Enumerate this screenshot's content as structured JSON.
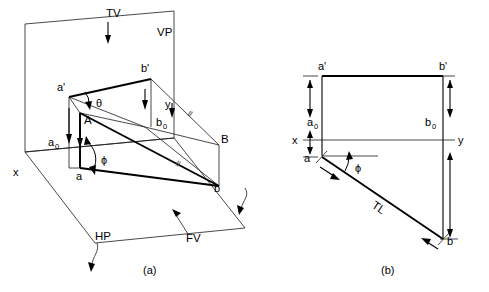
{
  "figure": {
    "panels": [
      {
        "key": "a",
        "caption": "(a)",
        "description": "Pictorial view showing line AB in space with VP and HP planes"
      },
      {
        "key": "b",
        "caption": "(b)",
        "description": "Orthographic projection with xy reference line"
      }
    ]
  },
  "colors": {
    "line": "#000000",
    "thin_line": "#1a1a1a",
    "background": "#ffffff",
    "parallel_mark": "#444444"
  },
  "panel_a": {
    "caption": "(a)",
    "planes": {
      "vp_label": "VP",
      "hp_label": "HP"
    },
    "projection_labels": {
      "tv": "TV",
      "fv": "FV"
    },
    "points": [
      {
        "name": "a-prime",
        "label": "a'",
        "x": 62,
        "y": 88
      },
      {
        "name": "b-prime",
        "label": "b'",
        "x": 143,
        "y": 69
      },
      {
        "name": "a-sub0",
        "label": "a",
        "sub": "0",
        "x": 52,
        "y": 142
      },
      {
        "name": "b-sub0",
        "label": "b",
        "sub": "0",
        "x": 160,
        "y": 122
      },
      {
        "name": "a-lower",
        "label": "a",
        "x": 79,
        "y": 175
      },
      {
        "name": "b-lower",
        "label": "b",
        "x": 213,
        "y": 188
      },
      {
        "name": "point-A",
        "label": "A",
        "x": 87,
        "y": 120
      },
      {
        "name": "point-B",
        "label": "B",
        "x": 222,
        "y": 139
      }
    ],
    "angles": [
      {
        "name": "theta",
        "label": "θ",
        "x": 100,
        "y": 103,
        "meaning": "angle with VP at a'"
      },
      {
        "name": "phi",
        "label": "ϕ",
        "x": 105,
        "y": 160,
        "meaning": "angle with HP at a"
      }
    ],
    "parallel_marks": [
      {
        "label": "ll",
        "x": 190,
        "y": 111
      },
      {
        "label": "ll",
        "x": 178,
        "y": 161
      }
    ],
    "axis_labels": [
      {
        "name": "x-axis",
        "label": "x",
        "x": 16,
        "y": 172
      },
      {
        "name": "y-axis",
        "label": "y",
        "x": 168,
        "y": 104
      }
    ]
  },
  "panel_b": {
    "caption": "(b)",
    "points": [
      {
        "name": "a-prime",
        "label": "a'",
        "x": 321,
        "y": 66
      },
      {
        "name": "b-prime",
        "label": "b'",
        "x": 442,
        "y": 66
      },
      {
        "name": "a-sub0",
        "label": "a",
        "sub": "0",
        "x": 312,
        "y": 122
      },
      {
        "name": "b-sub0",
        "label": "b",
        "sub": "0",
        "x": 430,
        "y": 122
      },
      {
        "name": "a-lower",
        "label": "a",
        "x": 307,
        "y": 156
      },
      {
        "name": "b-lower",
        "label": "b",
        "x": 448,
        "y": 238
      }
    ],
    "angles": [
      {
        "name": "phi",
        "label": "ϕ",
        "x": 352,
        "y": 164,
        "meaning": "angle of ab with xy"
      }
    ],
    "true_length_label": "TL",
    "axis_labels": [
      {
        "name": "x-axis",
        "label": "x",
        "x": 295,
        "y": 141
      },
      {
        "name": "y-axis",
        "label": "y",
        "x": 461,
        "y": 141
      }
    ]
  }
}
